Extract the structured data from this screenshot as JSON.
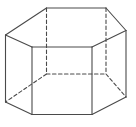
{
  "diagram": {
    "type": "hexagonal-prism",
    "background": "#ffffff",
    "stroke_color": "#4a4a4a",
    "stroke_width": 1.1,
    "dash_pattern": "3.5,2.5",
    "vertices": {
      "top_back_left": [
        46.5,
        8
      ],
      "top_back_right": [
        106,
        8
      ],
      "top_right": [
        126,
        30.5
      ],
      "top_front_right": [
        92,
        47
      ],
      "top_front_left": [
        32,
        47
      ],
      "top_left": [
        5.5,
        35
      ],
      "bot_back_left": [
        46.5,
        74
      ],
      "bot_back_right": [
        106,
        74
      ],
      "bot_right": [
        126,
        97
      ],
      "bot_front_right": [
        92,
        114.5
      ],
      "bot_front_left": [
        32,
        114.5
      ],
      "bot_left": [
        5.5,
        102
      ]
    },
    "visible_edges": [
      [
        "top_back_left",
        "top_back_right"
      ],
      [
        "top_back_right",
        "top_right"
      ],
      [
        "top_right",
        "top_front_right"
      ],
      [
        "top_front_right",
        "top_front_left"
      ],
      [
        "top_front_left",
        "top_left"
      ],
      [
        "top_left",
        "top_back_left"
      ],
      [
        "top_left",
        "bot_left"
      ],
      [
        "top_front_left",
        "bot_front_left"
      ],
      [
        "top_front_right",
        "bot_front_right"
      ],
      [
        "top_right",
        "bot_right"
      ],
      [
        "bot_left",
        "bot_front_left"
      ],
      [
        "bot_front_left",
        "bot_front_right"
      ],
      [
        "bot_front_right",
        "bot_right"
      ]
    ],
    "hidden_edges": [
      [
        "top_back_left",
        "bot_back_left"
      ],
      [
        "top_back_right",
        "bot_back_right"
      ],
      [
        "bot_back_left",
        "bot_back_right"
      ],
      [
        "bot_back_left",
        "bot_left"
      ],
      [
        "bot_back_right",
        "bot_right"
      ]
    ]
  }
}
